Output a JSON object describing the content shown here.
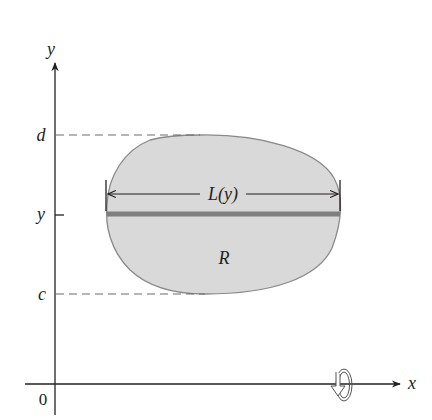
{
  "figure": {
    "axes": {
      "y_label": "y",
      "x_label": "x",
      "origin_label": "0"
    },
    "y_ticks": [
      {
        "label": "d",
        "meaning": "upper bound"
      },
      {
        "label": "y",
        "meaning": "variable height"
      },
      {
        "label": "c",
        "meaning": "lower bound"
      }
    ],
    "region_label": "R",
    "length_label": "L(y)",
    "rotation_icon": "rotation-about-x-axis-icon",
    "colors": {
      "region_fill": "#d9d9d9",
      "region_stroke": "#8a8a8a",
      "strip": "#7f7f7f",
      "axis": "#231f20",
      "dashed": "#6d6d6d"
    }
  }
}
